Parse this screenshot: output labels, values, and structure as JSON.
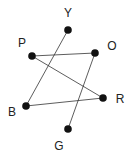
{
  "diagram": {
    "type": "graph",
    "nodes": [
      {
        "id": "Y",
        "label": "Y",
        "x": 68,
        "y": 30,
        "lx": 68,
        "ly": 14
      },
      {
        "id": "P",
        "label": "P",
        "x": 32,
        "y": 56,
        "lx": 22,
        "ly": 44
      },
      {
        "id": "O",
        "label": "O",
        "x": 95,
        "y": 53,
        "lx": 112,
        "ly": 47
      },
      {
        "id": "R",
        "label": "R",
        "x": 103,
        "y": 98,
        "lx": 120,
        "ly": 100
      },
      {
        "id": "B",
        "label": "B",
        "x": 26,
        "y": 106,
        "lx": 12,
        "ly": 113
      },
      {
        "id": "G",
        "label": "G",
        "x": 68,
        "y": 129,
        "lx": 59,
        "ly": 147
      }
    ],
    "edges": [
      {
        "from": "Y",
        "to": "B"
      },
      {
        "from": "P",
        "to": "O"
      },
      {
        "from": "P",
        "to": "R"
      },
      {
        "from": "B",
        "to": "R"
      },
      {
        "from": "O",
        "to": "G"
      }
    ],
    "colors": {
      "node": "#111111",
      "edge": "#333333",
      "label": "#222222",
      "background": "#ffffff"
    }
  }
}
